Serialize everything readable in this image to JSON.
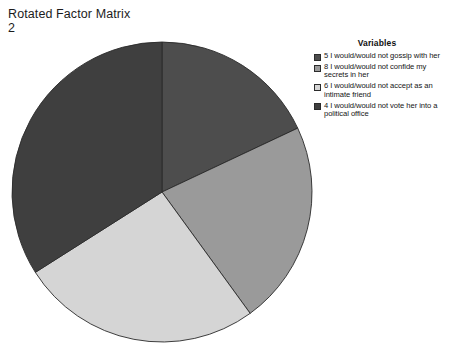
{
  "chart_title": "Rotated Factor Matrix\n2",
  "legend": {
    "title": "Variables",
    "items": [
      {
        "label": "5 I would/would not gossip with her",
        "color": "#4d4d4d"
      },
      {
        "label": "8 I would/would not confide my secrets in her",
        "color": "#9a9a9a"
      },
      {
        "label": "6 I would/would not accept as an intimate friend",
        "color": "#d5d5d5"
      },
      {
        "label": "4 I would/would not vote her into a political office",
        "color": "#3f3f3f"
      }
    ]
  },
  "chart_data": {
    "type": "pie",
    "title": "Rotated Factor Matrix 2",
    "legend_title": "Variables",
    "legend_position": "right",
    "start_angle_deg": 0,
    "direction": "clockwise",
    "center": {
      "x": 162,
      "y": 192
    },
    "radius": 150,
    "categories": [
      "5 I would/would not gossip with her",
      "8 I would/would not confide my secrets in her",
      "6 I would/would not accept as an intimate friend",
      "4 I would/would not vote her into a political office"
    ],
    "values": [
      18,
      22,
      26,
      34
    ],
    "unit": "percent",
    "colors": [
      "#4d4d4d",
      "#9a9a9a",
      "#d5d5d5",
      "#3f3f3f"
    ],
    "slice_angles_deg": [
      64.8,
      79.2,
      93.6,
      122.4
    ],
    "slice_boundaries_deg": [
      0,
      64.8,
      144.0,
      237.6,
      360
    ],
    "edge_color": "#2a2a2a",
    "grid": false
  }
}
